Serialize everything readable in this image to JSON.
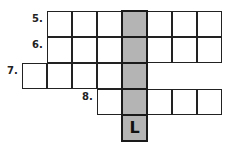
{
  "puzzle": {
    "clues": [
      {
        "number": "5.",
        "row": 0
      },
      {
        "number": "6.",
        "row": 1
      },
      {
        "number": "7.",
        "row": 2
      },
      {
        "number": "8.",
        "row": 3
      }
    ],
    "rows": [
      {
        "start_col": 1,
        "length": 7
      },
      {
        "start_col": 1,
        "length": 7
      },
      {
        "start_col": 0,
        "length": 5
      },
      {
        "start_col": 3,
        "length": 5
      },
      {
        "start_col": 4,
        "length": 1
      }
    ],
    "highlight_column": 4,
    "filled_letters": [
      {
        "row": 4,
        "col": 4,
        "letter": "L"
      }
    ],
    "colors": {
      "shaded": "#b4b4b4",
      "border": "#222222"
    }
  }
}
